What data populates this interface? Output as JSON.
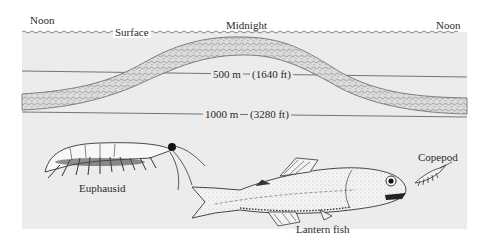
{
  "figure": {
    "time_labels": {
      "left": "Noon",
      "center": "Midnight",
      "right": "Noon"
    },
    "surface_label": "Surface",
    "depths": [
      {
        "meters": "500 m",
        "feet": "(1640 ft)"
      },
      {
        "meters": "1000 m",
        "feet": "(3280 ft)"
      }
    ],
    "organisms": [
      {
        "name": "Euphausid",
        "icon": "euphausid-krill-icon"
      },
      {
        "name": "Lantern fish",
        "icon": "lantern-fish-icon"
      },
      {
        "name": "Copepod",
        "icon": "copepod-icon"
      }
    ],
    "colors": {
      "water": "#ececec",
      "layer_fill": "#d9d9d9",
      "line": "#555555",
      "ink": "#2a2a2a"
    }
  }
}
